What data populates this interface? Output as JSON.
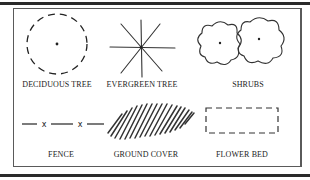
{
  "colors": {
    "ink": "#222222",
    "frame": "#5a5a5a",
    "rule": "#2a2a2a",
    "background": "#ffffff"
  },
  "legend": {
    "items": [
      {
        "id": "deciduous-tree",
        "label": "DECIDUOUS TREE",
        "symbol": "dashed-circle-with-center-dot"
      },
      {
        "id": "evergreen-tree",
        "label": "EVERGREEN TREE",
        "symbol": "eight-point-starburst"
      },
      {
        "id": "shrubs",
        "label": "SHRUBS",
        "symbol": "two-scalloped-outlines-with-center-dots"
      },
      {
        "id": "fence",
        "label": "FENCE",
        "symbol": "line-with-x-marks"
      },
      {
        "id": "ground-cover",
        "label": "GROUND COVER",
        "symbol": "diagonal-hatched-parallelogram"
      },
      {
        "id": "flower-bed",
        "label": "FLOWER BED",
        "symbol": "dashed-rectangle"
      }
    ]
  }
}
